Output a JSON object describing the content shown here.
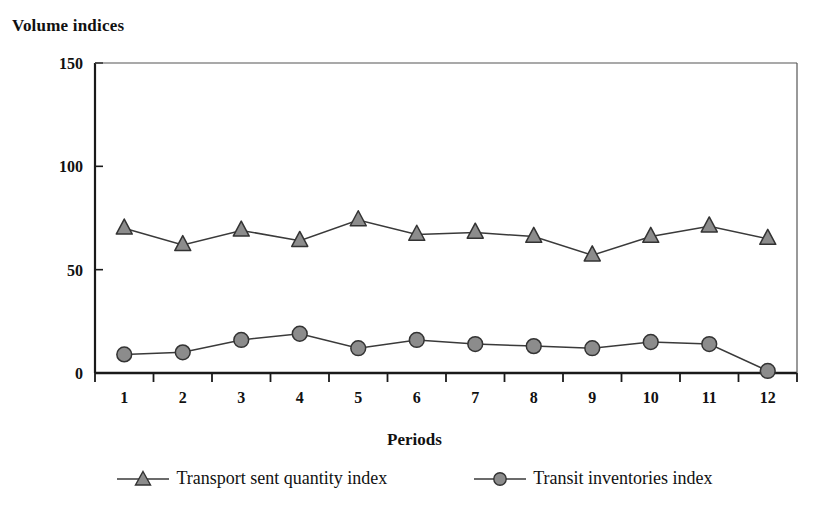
{
  "chart_data": {
    "type": "line",
    "title": "",
    "ylabel": "Volume indices",
    "xlabel": "Periods",
    "categories": [
      "1",
      "2",
      "3",
      "4",
      "5",
      "6",
      "7",
      "8",
      "9",
      "10",
      "11",
      "12"
    ],
    "ylim": [
      0,
      150
    ],
    "yticks": [
      0,
      50,
      100,
      150
    ],
    "ytick_labels": [
      "0",
      "50",
      "100",
      "150"
    ],
    "grid": false,
    "legend_position": "bottom",
    "series": [
      {
        "name": "Transport sent quantity index",
        "marker": "triangle",
        "color": "#8c8c8c",
        "stroke": "#333333",
        "values": [
          70,
          62,
          69,
          64,
          74,
          67,
          68,
          66,
          57,
          66,
          71,
          65
        ]
      },
      {
        "name": "Transit inventories index",
        "marker": "circle",
        "color": "#8c8c8c",
        "stroke": "#333333",
        "values": [
          9,
          10,
          16,
          19,
          12,
          16,
          14,
          13,
          12,
          15,
          14,
          1
        ]
      }
    ]
  },
  "axis": {
    "y_title": "Volume indices",
    "x_title": "Periods"
  },
  "legend": {
    "entries": [
      {
        "label": "Transport sent quantity index",
        "marker": "triangle-marker-icon"
      },
      {
        "label": "Transit inventories index",
        "marker": "circle-marker-icon"
      }
    ]
  },
  "colors": {
    "marker_fill": "#8c8c8c",
    "marker_stroke": "#333333",
    "line": "#3a3a3a",
    "axis": "#1a1a1a",
    "text": "#111111"
  }
}
